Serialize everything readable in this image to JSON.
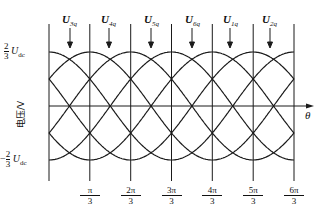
{
  "diagram": {
    "y_axis_label": "电压/V",
    "x_axis_label": "θ",
    "top_level": {
      "sign": "",
      "num": "2",
      "den": "3",
      "sym": "U",
      "sub": "dc"
    },
    "bottom_level": {
      "sign": "−",
      "num": "2",
      "den": "3",
      "sym": "U",
      "sub": "dc"
    },
    "x_ticks": [
      {
        "num": "π",
        "den": "3"
      },
      {
        "num": "2π",
        "den": "3"
      },
      {
        "num": "3π",
        "den": "3"
      },
      {
        "num": "4π",
        "den": "3"
      },
      {
        "num": "5π",
        "den": "3"
      },
      {
        "num": "6π",
        "den": "3"
      }
    ],
    "signals": [
      {
        "sym": "U",
        "sub": "3q"
      },
      {
        "sym": "U",
        "sub": "4q"
      },
      {
        "sym": "U",
        "sub": "5q"
      },
      {
        "sym": "U",
        "sub": "6q"
      },
      {
        "sym": "U",
        "sub": "1q"
      },
      {
        "sym": "U",
        "sub": "2q"
      }
    ],
    "line_color": "#1a1a1a"
  }
}
